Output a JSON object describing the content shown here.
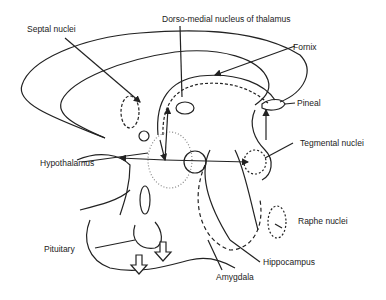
{
  "labels": {
    "septal": "Septal nuclei",
    "dorso_medial": "Dorso-medial nucleus of thalamus",
    "fornix": "Fornix",
    "pineal": "Pineal",
    "tegmental": "Tegmental nuclei",
    "hypothalamus": "Hypothalamus",
    "raphe": "Raphe nuclei",
    "hippocampus": "Hippocampus",
    "pituitary": "Pituitary",
    "amygdala": "Amygdala"
  },
  "colors": {
    "ink": "#222222",
    "stipple": "#888888",
    "background": "#ffffff"
  }
}
